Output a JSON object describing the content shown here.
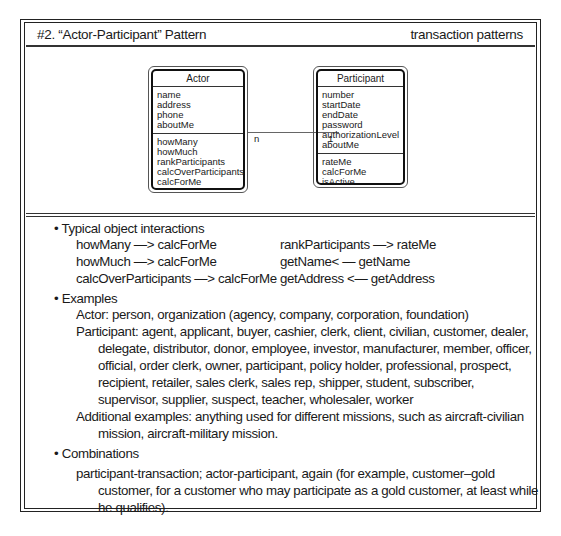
{
  "header": {
    "title": "#2. “Actor-Participant” Pattern",
    "category": "transaction patterns"
  },
  "diagram": {
    "actor": {
      "name": "Actor",
      "attributes": [
        "name",
        "address",
        "phone",
        "aboutMe"
      ],
      "methods": [
        "howMany",
        "howMuch",
        "rankParticipants",
        "calcOverParticipants",
        "calcForMe"
      ]
    },
    "participant": {
      "name": "Participant",
      "attributes": [
        "number",
        "startDate",
        "endDate",
        "password",
        "authorizationLevel",
        "aboutMe"
      ],
      "methods": [
        "rateMe",
        "calcForMe",
        "isActive"
      ]
    },
    "association": {
      "actor_multiplicity": "n",
      "participant_multiplicity": "1"
    }
  },
  "sections": {
    "interactions": {
      "heading": "• Typical object interactions",
      "left": [
        "howMany —> calcForMe",
        "howMuch —> calcForMe",
        "calcOverParticipants —> calcForMe"
      ],
      "right": [
        "rankParticipants —> rateMe",
        "getName< — getName",
        "getAddress <— getAddress"
      ]
    },
    "examples": {
      "heading": "• Examples",
      "lines": [
        "Actor: person, organization (agency, company, corporation, foundation)",
        "Participant: agent, applicant, buyer, cashier, clerk, client, civilian, customer, dealer,",
        "delegate, distributor, donor, employee, investor, manufacturer, member, officer,",
        "official, order clerk, owner, participant, policy holder, professional, prospect,",
        "recipient, retailer, sales clerk, sales rep, shipper, student, subscriber,",
        "supervisor, supplier, suspect, teacher, wholesaler, worker",
        "Additional examples: anything used for different missions, such as aircraft-civilian",
        "mission, aircraft-military mission."
      ]
    },
    "combinations": {
      "heading": "• Combinations",
      "lines": [
        "participant-transaction; actor-participant, again (for example, customer–gold",
        "customer, for a customer who may participate as a gold customer, at least while",
        "he qualifies)."
      ]
    }
  }
}
